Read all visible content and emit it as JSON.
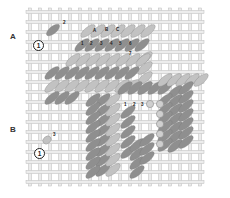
{
  "diagram": {
    "type": "needlepoint-stitch-diagram",
    "grid": {
      "x0": 30,
      "y0": 12,
      "cols": 17,
      "rows": 17,
      "cell": 10,
      "thread_color": "#d6d6d6",
      "thread_edge": "#bdbdbd"
    },
    "colors": {
      "dark_stitch": "#8f8f8f",
      "light_stitch": "#c2c2c2",
      "bead": "#cfcfcf",
      "label": "#333333"
    },
    "section_labels": [
      {
        "text": "A",
        "x": 10,
        "y": 32
      },
      {
        "text": "B",
        "x": 10,
        "y": 125
      }
    ],
    "start_markers": [
      {
        "text": "1",
        "x": 33,
        "y": 40
      },
      {
        "text": "1",
        "x": 34,
        "y": 148
      }
    ],
    "step_numbers": [
      {
        "text": "2",
        "x": 63,
        "y": 21
      },
      {
        "text": "3",
        "x": 53,
        "y": 133
      },
      {
        "text": "A",
        "x": 93,
        "y": 29
      },
      {
        "text": "B",
        "x": 105,
        "y": 28
      },
      {
        "text": "C",
        "x": 116,
        "y": 28
      },
      {
        "text": "1",
        "x": 81,
        "y": 42
      },
      {
        "text": "2",
        "x": 90,
        "y": 42
      },
      {
        "text": "3",
        "x": 100,
        "y": 42
      },
      {
        "text": "4",
        "x": 110,
        "y": 42
      },
      {
        "text": "5",
        "x": 119,
        "y": 42
      },
      {
        "text": "6",
        "x": 129,
        "y": 42
      },
      {
        "text": "7",
        "x": 129,
        "y": 52
      },
      {
        "text": "1",
        "x": 124,
        "y": 103
      },
      {
        "text": "2",
        "x": 133,
        "y": 103
      },
      {
        "text": "3",
        "x": 141,
        "y": 103
      }
    ]
  }
}
